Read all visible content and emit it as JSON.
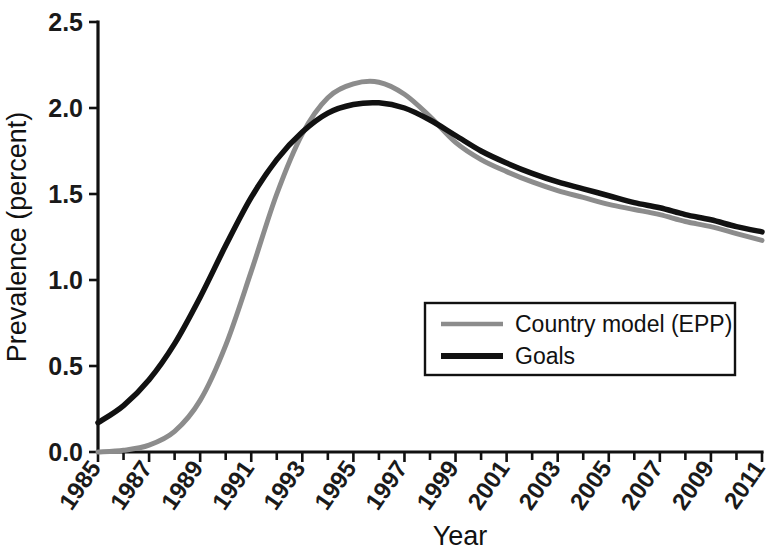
{
  "chart_data": {
    "type": "line",
    "title": "",
    "xlabel": "Year",
    "ylabel": "Prevalence (percent)",
    "xlim": [
      1985,
      2011
    ],
    "ylim": [
      0.0,
      2.5
    ],
    "ytick_values": [
      0.0,
      0.5,
      1.0,
      1.5,
      2.0,
      2.5
    ],
    "ytick_labels": [
      "0.0",
      "0.5",
      "1.0",
      "1.5",
      "2.0",
      "2.5"
    ],
    "xtick_values": [
      1985,
      1987,
      1989,
      1991,
      1993,
      1995,
      1997,
      1999,
      2001,
      2003,
      2005,
      2007,
      2009,
      2011
    ],
    "xtick_labels": [
      "1985",
      "1987",
      "1989",
      "1991",
      "1993",
      "1995",
      "1997",
      "1999",
      "2001",
      "2003",
      "2005",
      "2007",
      "2009",
      "2011"
    ],
    "xminor_values": [
      1986,
      1988,
      1990,
      1992,
      1994,
      1996,
      1998,
      2000,
      2002,
      2004,
      2006,
      2008,
      2010
    ],
    "grid": false,
    "legend_position": "center-right",
    "x": [
      1985,
      1986,
      1987,
      1988,
      1989,
      1990,
      1991,
      1992,
      1993,
      1994,
      1995,
      1996,
      1997,
      1998,
      1999,
      2000,
      2001,
      2002,
      2003,
      2004,
      2005,
      2006,
      2007,
      2008,
      2009,
      2010,
      2011
    ],
    "series": [
      {
        "name": "Country model (EPP)",
        "color": "#8c8c8c",
        "linewidth": 5,
        "values": [
          0.0,
          0.01,
          0.04,
          0.12,
          0.3,
          0.62,
          1.05,
          1.5,
          1.85,
          2.06,
          2.14,
          2.15,
          2.08,
          1.95,
          1.8,
          1.7,
          1.63,
          1.57,
          1.52,
          1.48,
          1.44,
          1.41,
          1.38,
          1.34,
          1.31,
          1.27,
          1.23
        ]
      },
      {
        "name": "Goals",
        "color": "#111111",
        "linewidth": 5.5,
        "values": [
          0.17,
          0.27,
          0.42,
          0.63,
          0.9,
          1.2,
          1.48,
          1.7,
          1.86,
          1.97,
          2.02,
          2.03,
          2.0,
          1.93,
          1.84,
          1.75,
          1.68,
          1.62,
          1.57,
          1.53,
          1.49,
          1.45,
          1.42,
          1.38,
          1.35,
          1.31,
          1.28
        ]
      }
    ],
    "legend_entries": [
      {
        "label": "Country model (EPP)",
        "color": "#8c8c8c"
      },
      {
        "label": "Goals",
        "color": "#111111"
      }
    ]
  }
}
